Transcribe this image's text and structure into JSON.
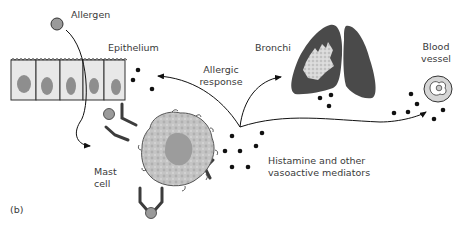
{
  "figure": {
    "panel_label": "(b)",
    "labels": {
      "allergen": "Allergen",
      "epithelium": "Epithelium",
      "bronchi": "Bronchi",
      "allergic_response_1": "Allergic",
      "allergic_response_2": "response",
      "blood_vessel_1": "Blood",
      "blood_vessel_2": "vessel",
      "mast_cell_1": "Mast",
      "mast_cell_2": "cell",
      "mediators_1": "Histamine and other",
      "mediators_2": "vasoactive mediators"
    },
    "colors": {
      "allergen": "#9a9a9a",
      "cell_body": "#e6e6e6",
      "nucleus": "#8e8e8e",
      "mast_cell": "#bdbdbd",
      "mast_nucleus": "#9c9c9c",
      "lung": "#4a4a4a",
      "antibody": "#3c3c3c",
      "mediator_dot": "#111111"
    }
  }
}
